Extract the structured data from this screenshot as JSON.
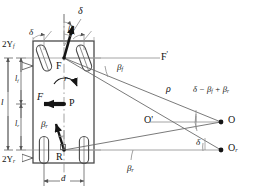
{
  "figure": {
    "kind": "vehicle-kinematics-diagram",
    "stroke_color": "#6b6b6b",
    "body_color": "#4a4a4a",
    "text_color": "#111111",
    "width": 255,
    "height": 196
  },
  "points": {
    "front_axle_center": "F",
    "center_of_gravity": "P",
    "rear_axle_center": "R",
    "turn_center": "O",
    "intermediate_center": "O'",
    "rear_turn_center": "O",
    "rear_turn_center_sub": "r",
    "front_axis_ref": "F",
    "front_axis_ref_prime": "'"
  },
  "angles": {
    "steer_top": "δ",
    "steer_left_wheel": "δ",
    "steer_right_wheel": "δ",
    "beta_front_symbol": "β",
    "beta_front_sub": "f",
    "beta_front_upper_symbol": "β",
    "beta_front_upper_sub": "f",
    "beta_rear_symbol": "β",
    "beta_rear_sub": "r",
    "beta_rear_lower_symbol": "β",
    "beta_rear_lower_sub": "r",
    "combined": "δ − β",
    "combined_sub1": "f",
    "combined_mid": " + β",
    "combined_sub2": "r",
    "delta_at_Or": "δ"
  },
  "quantities": {
    "radius_symbol": "ρ",
    "yaw_rate_symbol": "r",
    "force_symbol": "F"
  },
  "dimensions": {
    "track_front_value": "2Y",
    "track_front_sub": "f",
    "track_rear_value": "2Y",
    "track_rear_sub": "r",
    "len_front": "l",
    "len_front_sub": "f",
    "len_rear": "l",
    "len_rear_sub": "r",
    "wheelbase": "l",
    "width": "d"
  }
}
